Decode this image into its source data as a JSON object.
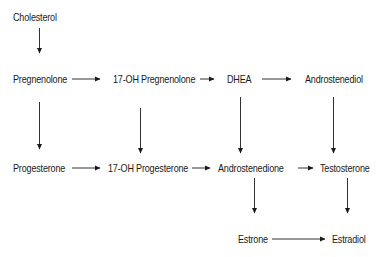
{
  "diagram": {
    "type": "steroid-biosynthesis-pathway",
    "nodes": {
      "cholesterol": "Cholesterol",
      "pregnenolone": "Pregnenolone",
      "oh17_pregnenolone": "17-OH Pregnenolone",
      "dhea": "DHEA",
      "androstenediol": "Androstenediol",
      "progesterone": "Progesterone",
      "oh17_progesterone": "17-OH Progesterone",
      "androstenedione": "Androstenedione",
      "testosterone": "Testosterone",
      "estrone": "Estrone",
      "estradiol": "Estradiol"
    },
    "edges": [
      [
        "Cholesterol",
        "Pregnenolone"
      ],
      [
        "Pregnenolone",
        "17-OH Pregnenolone"
      ],
      [
        "17-OH Pregnenolone",
        "DHEA"
      ],
      [
        "DHEA",
        "Androstenediol"
      ],
      [
        "Pregnenolone",
        "Progesterone"
      ],
      [
        "17-OH Pregnenolone",
        "17-OH Progesterone"
      ],
      [
        "DHEA",
        "Androstenedione"
      ],
      [
        "Androstenediol",
        "Testosterone"
      ],
      [
        "Progesterone",
        "17-OH Progesterone"
      ],
      [
        "17-OH Progesterone",
        "Androstenedione"
      ],
      [
        "Androstenedione",
        "Testosterone"
      ],
      [
        "Androstenedione",
        "Estrone"
      ],
      [
        "Testosterone",
        "Estradiol"
      ],
      [
        "Estrone",
        "Estradiol"
      ]
    ],
    "colors": {
      "text": "#1a1a1a",
      "arrow": "#1a1a1a",
      "background": "#ffffff"
    }
  }
}
